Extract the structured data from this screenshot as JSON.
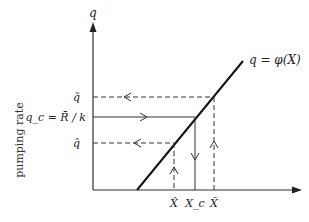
{
  "diagram": {
    "y_axis_label": "q",
    "side_label": "pumping rate",
    "curve_label": "q = φ(X)",
    "y_ticks": {
      "q_tilde": "q̃",
      "q_c": "q_c = R̄ / k",
      "q_hat": "q̂"
    },
    "x_ticks": {
      "x_hat": "X̂",
      "x_c": "X_c",
      "x_tilde": "X̃"
    },
    "colors": {
      "ink": "#222222",
      "background": "#ffffff"
    }
  }
}
